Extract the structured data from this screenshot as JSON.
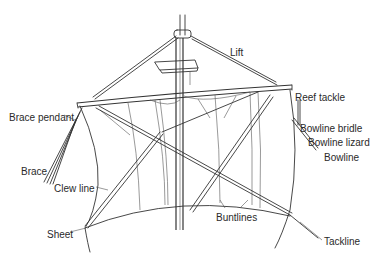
{
  "diagram": {
    "labels": [
      {
        "id": "lift",
        "text": "Lift",
        "x": 230,
        "y": 48
      },
      {
        "id": "reef-tackle",
        "text": "Reef tackle",
        "x": 295,
        "y": 93
      },
      {
        "id": "brace-pendant",
        "text": "Brace pendant",
        "x": 9,
        "y": 113
      },
      {
        "id": "bowline-bridle",
        "text": "Bowline bridle",
        "x": 300,
        "y": 124
      },
      {
        "id": "bowline-lizard",
        "text": "Bowline lizard",
        "x": 308,
        "y": 138
      },
      {
        "id": "brace",
        "text": "Brace",
        "x": 21,
        "y": 167
      },
      {
        "id": "bowline",
        "text": "Bowline",
        "x": 324,
        "y": 153
      },
      {
        "id": "clew-line",
        "text": "Clew line",
        "x": 54,
        "y": 184
      },
      {
        "id": "buntlines",
        "text": "Buntlines",
        "x": 216,
        "y": 213
      },
      {
        "id": "sheet",
        "text": "Sheet",
        "x": 47,
        "y": 230
      },
      {
        "id": "tackline",
        "text": "Tackline",
        "x": 324,
        "y": 237
      }
    ]
  }
}
